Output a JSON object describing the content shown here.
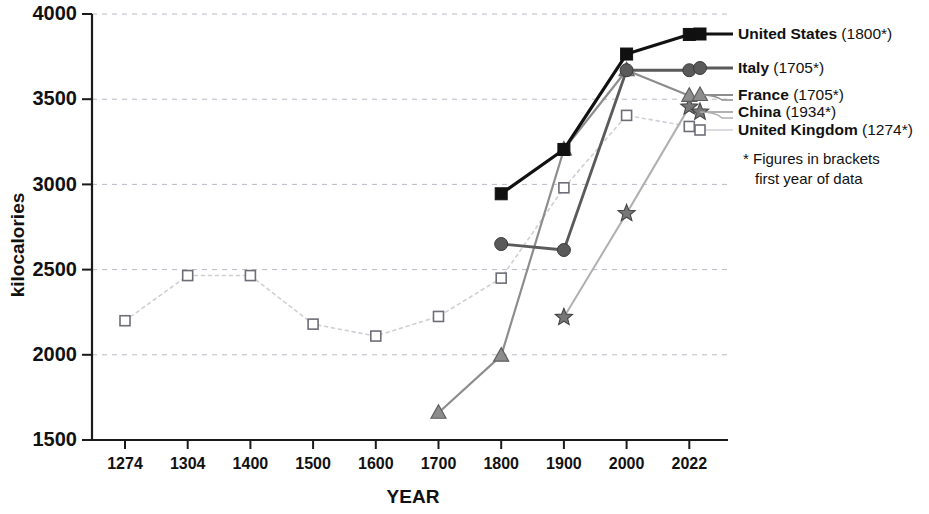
{
  "chart_data": {
    "type": "line",
    "title": "",
    "xlabel": "YEAR",
    "ylabel": "kilocalories",
    "categories": [
      "1274",
      "1304",
      "1400",
      "1500",
      "1600",
      "1700",
      "1800",
      "1900",
      "2000",
      "2022"
    ],
    "ylim": [
      1500,
      4000
    ],
    "yticks": [
      "1500",
      "2000",
      "2500",
      "3000",
      "3500",
      "4000"
    ],
    "grid": true,
    "legend_position": "right",
    "series": [
      {
        "name": "United States",
        "first_year": "(1800*)",
        "marker": "filled-square",
        "color": "#111111",
        "line_width": 3.2,
        "values": [
          null,
          null,
          null,
          null,
          null,
          null,
          2945,
          3205,
          3765,
          3880
        ]
      },
      {
        "name": "Italy",
        "first_year": "(1705*)",
        "marker": "filled-circle",
        "color": "#5a5a5a",
        "line_width": 2.8,
        "values": [
          null,
          null,
          null,
          null,
          null,
          null,
          2650,
          2615,
          3670,
          3670
        ]
      },
      {
        "name": "France",
        "first_year": "(1705*)",
        "marker": "filled-triangle",
        "color": "#8d8d8d",
        "line_width": 2.2,
        "values": [
          null,
          null,
          null,
          null,
          null,
          1660,
          1995,
          3205,
          3670,
          3520
        ]
      },
      {
        "name": "China",
        "first_year": "(1934*)",
        "marker": "star",
        "color": "#b0b0b0",
        "line_width": 2.0,
        "values": [
          null,
          null,
          null,
          null,
          null,
          null,
          null,
          2220,
          2830,
          3455
        ]
      },
      {
        "name": "United Kingdom",
        "first_year": "(1274*)",
        "marker": "open-square",
        "color": "#cfcfd6",
        "line_width": 1.6,
        "values": [
          2200,
          2465,
          2465,
          2180,
          2110,
          2225,
          2450,
          2980,
          3405,
          3340
        ]
      }
    ],
    "footnote_line1": "* Figures in brackets",
    "footnote_line2": "first year of data"
  }
}
